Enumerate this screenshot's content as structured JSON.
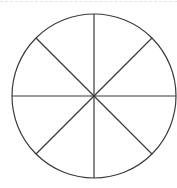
{
  "canvas": {
    "width": 177,
    "height": 188,
    "background_color": "#ffffff"
  },
  "top_rule": {
    "name": "top-dashed-rule",
    "style": "dashed",
    "color": "#e2e2e4",
    "thickness": 1,
    "y": 1,
    "x_start": 0,
    "x_end": 177
  },
  "figure": {
    "title": "",
    "kind": "circle-divided-into-equal-sectors",
    "sector_count": 8,
    "fraction_per_sector": "1/8",
    "shaded_sector_count": 0,
    "stroke_color": "#3a3a3a",
    "stroke_width": 1.2,
    "fill_color": "none",
    "circle": {
      "center_x": 94,
      "center_y": 96,
      "radius": 82
    },
    "diameters": [
      {
        "label": "vertical",
        "angle_degrees": 90
      },
      {
        "label": "horizontal",
        "angle_degrees": 0
      },
      {
        "label": "diagonal-nw-se",
        "angle_degrees": 135
      },
      {
        "label": "diagonal-ne-sw",
        "angle_degrees": 45
      }
    ],
    "sector_angles_degrees": [
      0,
      45,
      90,
      135,
      180,
      225,
      270,
      315
    ],
    "labels": []
  }
}
